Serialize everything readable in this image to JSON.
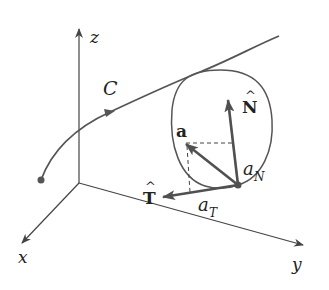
{
  "diagram": {
    "type": "3d-curve-acceleration-decomposition",
    "axes": {
      "x_label": "x",
      "y_label": "y",
      "z_label": "z"
    },
    "curve": {
      "label": "C"
    },
    "vectors": {
      "acceleration": "a",
      "unit_normal": "N",
      "unit_tangent": "T",
      "hat": "^"
    },
    "components": {
      "normal": {
        "base": "a",
        "sub": "N"
      },
      "tangential": {
        "base": "a",
        "sub": "T"
      }
    },
    "colors": {
      "curve": "#555555",
      "vectors": "#505050",
      "axes": "#444444",
      "text": "#222222"
    }
  }
}
